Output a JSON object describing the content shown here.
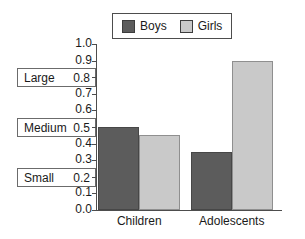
{
  "chart_data": {
    "type": "bar",
    "title": "",
    "xlabel": "",
    "ylabel": "",
    "categories": [
      "Children",
      "Adolescents"
    ],
    "series": [
      {
        "name": "Boys",
        "color": "#5c5c5c",
        "values": [
          0.5,
          0.35
        ]
      },
      {
        "name": "Girls",
        "color": "#c9c9c9",
        "values": [
          0.45,
          0.9
        ]
      }
    ],
    "ylim": [
      0.0,
      1.0
    ],
    "ytick_values": [
      0.0,
      0.1,
      0.2,
      0.3,
      0.4,
      0.5,
      0.6,
      0.7,
      0.8,
      0.9,
      1.0
    ],
    "ytick_labels": [
      "0.0",
      "0.1",
      "0.2",
      "0.3",
      "0.4",
      "0.5",
      "0.6",
      "0.7",
      "0.8",
      "0.9",
      "1.0"
    ],
    "grid": false,
    "legend_position": "top-center",
    "annotations": [
      {
        "label": "Large",
        "value": 0.8,
        "value_label": "0.8"
      },
      {
        "label": "Medium",
        "value": 0.5,
        "value_label": "0.5"
      },
      {
        "label": "Small",
        "value": 0.2,
        "value_label": "0.2"
      }
    ]
  },
  "legend": {
    "entries": [
      {
        "label": "Boys",
        "swatch": "legend-swatch-boys"
      },
      {
        "label": "Girls",
        "swatch": "legend-swatch-girls"
      }
    ]
  }
}
